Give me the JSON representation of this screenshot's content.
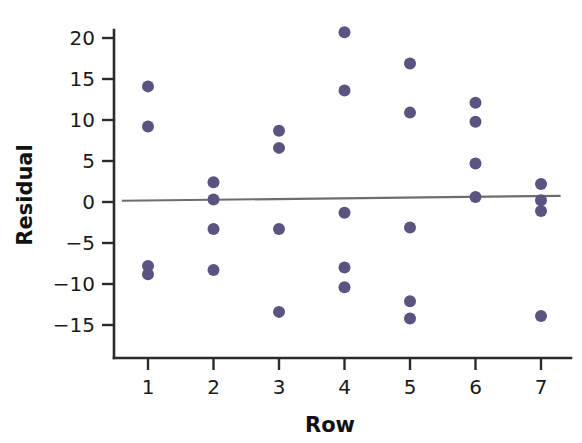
{
  "chart_data": {
    "type": "scatter",
    "title": "",
    "xlabel": "Row",
    "ylabel": "Residual",
    "xlim": [
      0.55,
      7.45
    ],
    "ylim": [
      -17.5,
      22.5
    ],
    "xticks": [
      1,
      2,
      3,
      4,
      5,
      6,
      7
    ],
    "xtick_labels": [
      "1",
      "2",
      "3",
      "4",
      "5",
      "6",
      "7"
    ],
    "yticks": [
      20,
      15,
      10,
      5,
      0,
      -5,
      -10,
      -15
    ],
    "ytick_labels": [
      "20",
      "15",
      "10",
      "5",
      "0",
      "−5",
      "−10",
      "−15"
    ],
    "grid": false,
    "legend": null,
    "marker_color": "#5a5480",
    "marker_size": 9,
    "points": [
      {
        "x": 1,
        "y": 14.1
      },
      {
        "x": 1,
        "y": 9.2
      },
      {
        "x": 1,
        "y": -7.8
      },
      {
        "x": 1,
        "y": -8.8
      },
      {
        "x": 2,
        "y": 2.4
      },
      {
        "x": 2,
        "y": 0.3
      },
      {
        "x": 2,
        "y": -3.3
      },
      {
        "x": 2,
        "y": -8.3
      },
      {
        "x": 3,
        "y": 8.7
      },
      {
        "x": 3,
        "y": 6.6
      },
      {
        "x": 3,
        "y": -3.3
      },
      {
        "x": 3,
        "y": -13.4
      },
      {
        "x": 4,
        "y": 20.7
      },
      {
        "x": 4,
        "y": 13.6
      },
      {
        "x": 4,
        "y": -1.3
      },
      {
        "x": 4,
        "y": -8.0
      },
      {
        "x": 4,
        "y": -10.4
      },
      {
        "x": 5,
        "y": 16.9
      },
      {
        "x": 5,
        "y": 10.9
      },
      {
        "x": 5,
        "y": -3.1
      },
      {
        "x": 5,
        "y": -12.1
      },
      {
        "x": 5,
        "y": -14.2
      },
      {
        "x": 6,
        "y": 12.1
      },
      {
        "x": 6,
        "y": 9.8
      },
      {
        "x": 6,
        "y": 4.7
      },
      {
        "x": 6,
        "y": 0.6
      },
      {
        "x": 7,
        "y": 2.2
      },
      {
        "x": 7,
        "y": 0.2
      },
      {
        "x": 7,
        "y": -1.1
      },
      {
        "x": 7,
        "y": -13.9
      }
    ],
    "fit_line": {
      "color": "#6d6d6d",
      "x_start": 0.6,
      "y_start": 0.15,
      "x_end": 7.3,
      "y_end": 0.75
    }
  }
}
